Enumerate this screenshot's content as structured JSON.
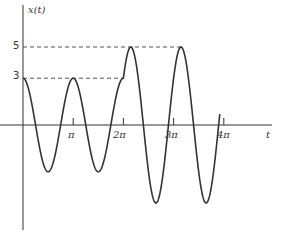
{
  "chart_data": {
    "type": "line",
    "title": "",
    "ylabel": "x(t)",
    "xlabel": "t",
    "x_ticks": [
      "π",
      "2π",
      "3π",
      "4π"
    ],
    "y_ticks": [
      "3",
      "5"
    ],
    "reference_lines": [
      {
        "value": 3,
        "style": "dashed",
        "from_t": 0,
        "to_t": "2π"
      },
      {
        "value": 5,
        "style": "dashed",
        "from_t": 0,
        "to_t": "3π"
      }
    ],
    "segments": [
      {
        "t_range": [
          "0",
          "2π"
        ],
        "amplitude": 3,
        "description": "3 cos(2t)"
      },
      {
        "t_range": [
          "2π",
          "≈3.9π"
        ],
        "amplitude": 5,
        "description": "amplitude 5 oscillation continuing from value 3 at t=2π"
      }
    ],
    "peaks": [
      {
        "t": "0",
        "value": 3
      },
      {
        "t": "π",
        "value": 3
      },
      {
        "t": "≈2.1π",
        "value": 5
      },
      {
        "t": "≈3.1π",
        "value": 5
      }
    ],
    "troughs": [
      {
        "t": "0.5π",
        "value": -3
      },
      {
        "t": "1.5π",
        "value": -3
      },
      {
        "t": "≈2.6π",
        "value": -5
      },
      {
        "t": "≈3.6π",
        "value": -5
      }
    ],
    "grid": false,
    "legend": null
  },
  "axes": {
    "y_label": "x(t)",
    "x_label": "t",
    "x_tick_labels": [
      "π",
      "2π",
      "3π",
      "4π"
    ],
    "y_tick_labels": [
      "3",
      "5"
    ]
  }
}
